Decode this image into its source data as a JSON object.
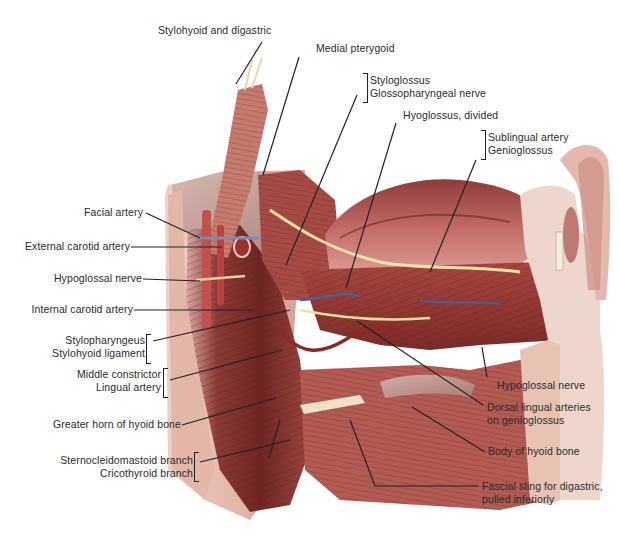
{
  "figure": {
    "colors": {
      "muscle_dark": "#7a2a2a",
      "muscle_mid": "#b2524a",
      "muscle_light": "#d98b7e",
      "skin_cut": "#e7b9a8",
      "fascia": "#c9a9a4",
      "nerve": "#f1e3a3",
      "artery": "#b0302c",
      "vein": "#4a5e9a",
      "bone": "#efe2c9",
      "leader": "#222222",
      "label_text": "#2a2a2a"
    }
  },
  "labels": {
    "stylohyoid_digastric": {
      "lines": [
        "Stylohyoid and digastric"
      ]
    },
    "medial_pterygoid": {
      "lines": [
        "Medial pterygoid"
      ]
    },
    "styloglossus_group": {
      "lines": [
        "Styloglossus",
        "Glossopharyngeal nerve"
      ]
    },
    "hyoglossus_divided": {
      "lines": [
        "Hyoglossus, divided"
      ]
    },
    "sublingual_group": {
      "lines": [
        "Sublingual artery",
        "Genioglossus"
      ]
    },
    "facial_artery": {
      "lines": [
        "Facial artery"
      ]
    },
    "external_carotid": {
      "lines": [
        "External carotid artery"
      ]
    },
    "hypoglossal_nerve_left": {
      "lines": [
        "Hypoglossal nerve"
      ]
    },
    "internal_carotid": {
      "lines": [
        "Internal carotid artery"
      ]
    },
    "stylopharyngeus_group": {
      "lines": [
        "Stylopharyngeus",
        "Stylohyoid ligament"
      ]
    },
    "middle_constrictor_group": {
      "lines": [
        "Middle constrictor",
        "Lingual artery"
      ]
    },
    "greater_horn": {
      "lines": [
        "Greater horn of hyoid bone"
      ]
    },
    "scm_cricothyroid_group": {
      "lines": [
        "Sternocleidomastoid branch",
        "Cricothyroid branch"
      ]
    },
    "hypoglossal_nerve_right": {
      "lines": [
        "Hypoglossal nerve"
      ]
    },
    "dorsal_lingual": {
      "lines": [
        "Dorsal lingual arteries",
        "on genioglossus"
      ]
    },
    "body_of_hyoid": {
      "lines": [
        "Body of hyoid bone"
      ]
    },
    "fascial_sling": {
      "lines": [
        "Fascial sling for digastric,",
        "pulled inferiorly"
      ]
    }
  }
}
